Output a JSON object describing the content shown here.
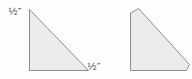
{
  "colors": {
    "background": "#fdfdfd",
    "shape_fill": "#ececec",
    "shape_stroke": "#8e8e8e",
    "label_text": "#3c3c3c"
  },
  "diagram": {
    "left_triangle": {
      "top_label": "½″",
      "bottom_label": "½″"
    }
  }
}
